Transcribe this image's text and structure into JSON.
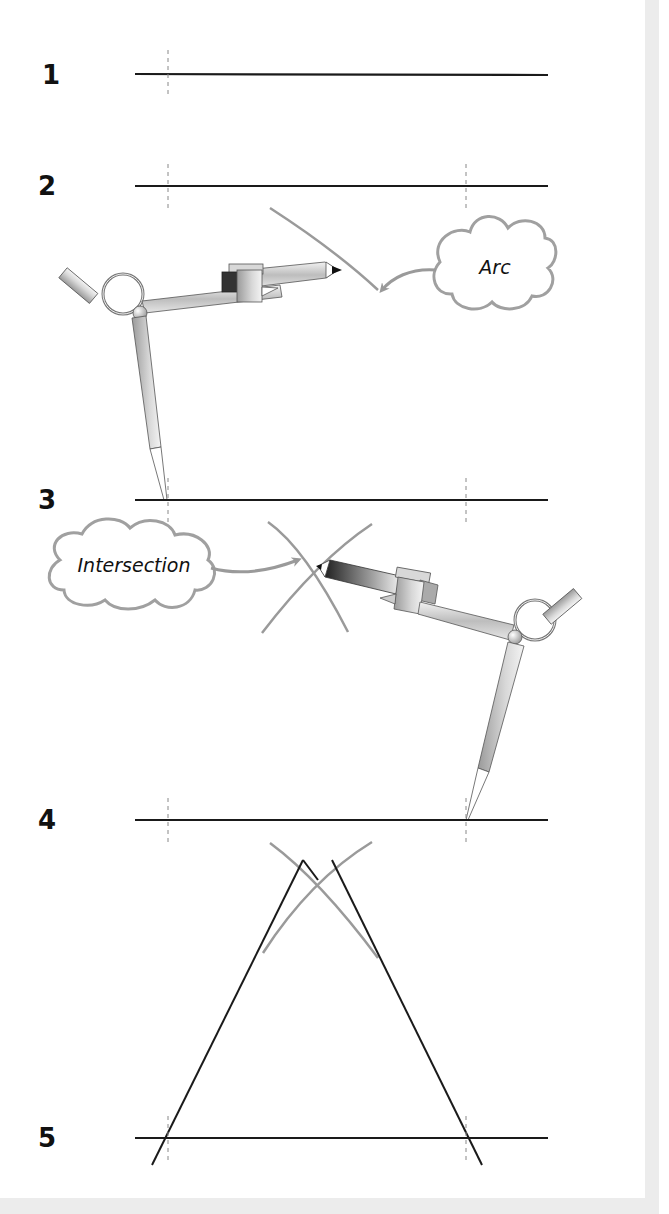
{
  "diagram": {
    "steps": [
      {
        "number": "1",
        "label_y": 62,
        "line_y": 74,
        "description": "Draw base line"
      },
      {
        "number": "2",
        "label_y": 173,
        "line_y": 186,
        "description": "Mark length on line"
      },
      {
        "number": "3",
        "label_y": 487,
        "line_y": 500,
        "description": "Draw arc from left point"
      },
      {
        "number": "4",
        "label_y": 807,
        "line_y": 820,
        "description": "Draw arc from right point to find intersection"
      },
      {
        "number": "5",
        "label_y": 1125,
        "line_y": 1138,
        "description": "Join intersection to both ends"
      }
    ],
    "callouts": {
      "arc": "Arc",
      "intersection": "Intersection"
    },
    "colors": {
      "line": "#1a1a1a",
      "arc": "#9a9a9a",
      "guide": "#888888",
      "frame": "#ececec",
      "cloud_stroke": "#a0a0a0"
    }
  }
}
